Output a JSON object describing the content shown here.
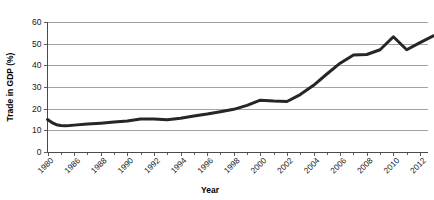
{
  "chart_data": {
    "type": "line",
    "title": "",
    "xlabel": "Year",
    "ylabel": "Trade in GDP (%)",
    "xlim": [
      1980,
      2013
    ],
    "ylim": [
      0,
      60
    ],
    "grid": true,
    "legend": "none",
    "x_tick_labels": [
      "1980",
      "1986",
      "1988",
      "1990",
      "1992",
      "1994",
      "1996",
      "1998",
      "2000",
      "2002",
      "2004",
      "2006",
      "2008",
      "2010",
      "2012"
    ],
    "y_tick_labels": [
      "0",
      "10",
      "20",
      "30",
      "40",
      "50",
      "60"
    ],
    "y_ticks": [
      0,
      10,
      20,
      30,
      40,
      50,
      60
    ],
    "series": [
      {
        "name": "Trade in GDP",
        "color": "#262626",
        "x": [
          1980,
          1981,
          1982,
          1983,
          1984,
          1985,
          1986,
          1987,
          1988,
          1989,
          1990,
          1991,
          1992,
          1993,
          1994,
          1995,
          1996,
          1997,
          1998,
          1999,
          2000,
          2001,
          2002,
          2003,
          2004,
          2005,
          2006,
          2007,
          2008,
          2009,
          2010,
          2011,
          2012,
          2013
        ],
        "values": [
          15.0,
          13.6,
          12.6,
          12.2,
          12.1,
          12.2,
          12.4,
          12.9,
          13.3,
          13.8,
          14.3,
          15.2,
          15.2,
          14.9,
          15.6,
          16.6,
          17.5,
          18.6,
          19.7,
          21.5,
          23.9,
          23.5,
          23.3,
          26.5,
          30.8,
          36.0,
          41.0,
          44.8,
          45.0,
          47.2,
          53.2,
          47.2,
          50.5,
          53.6
        ]
      }
    ]
  },
  "axis": {
    "y_title": "Trade in GDP (%)",
    "x_title": "Year"
  }
}
